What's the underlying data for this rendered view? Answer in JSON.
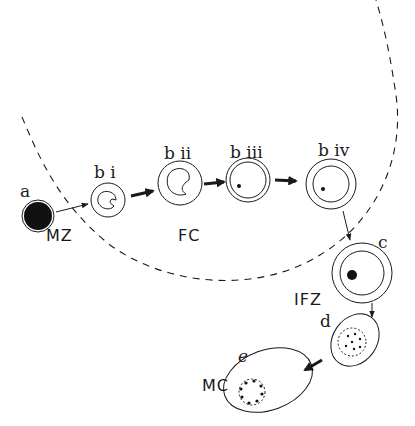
{
  "diagram": {
    "type": "cell-maturation-sequence",
    "stages": [
      {
        "id": "a",
        "label": "a",
        "shape": "filled-circle"
      },
      {
        "id": "bi",
        "label": "b i",
        "shape": "double-circle-with-indented-inner"
      },
      {
        "id": "bii",
        "label": "b ii",
        "shape": "double-circle-with-indented-inner"
      },
      {
        "id": "biii",
        "label": "b iii",
        "shape": "double-circle-with-dot"
      },
      {
        "id": "biv",
        "label": "b iv",
        "shape": "double-circle-with-dot"
      },
      {
        "id": "c",
        "label": "c",
        "shape": "double-circle-with-large-dot"
      },
      {
        "id": "d",
        "label": "d",
        "shape": "oval-with-dotted-inner-circle"
      },
      {
        "id": "e",
        "label": "e",
        "shape": "oval-with-ring-of-dots"
      }
    ],
    "zones": [
      {
        "id": "MZ",
        "label": "MZ"
      },
      {
        "id": "FC",
        "label": "FC"
      },
      {
        "id": "IFZ",
        "label": "IFZ"
      },
      {
        "id": "MC",
        "label": "MC"
      }
    ],
    "arrows": [
      {
        "from": "a",
        "to": "bi",
        "style": "thin"
      },
      {
        "from": "bi",
        "to": "bii",
        "style": "bold"
      },
      {
        "from": "bii",
        "to": "biii",
        "style": "bold"
      },
      {
        "from": "biii",
        "to": "biv",
        "style": "bold"
      },
      {
        "from": "biv",
        "to": "c",
        "style": "thin"
      },
      {
        "from": "c",
        "to": "d",
        "style": "thin"
      },
      {
        "from": "d",
        "to": "e",
        "style": "bold"
      }
    ],
    "boundary": {
      "style": "dashed-arc"
    },
    "colors": {
      "ink": "#1a1a1a",
      "background": "#ffffff"
    }
  }
}
